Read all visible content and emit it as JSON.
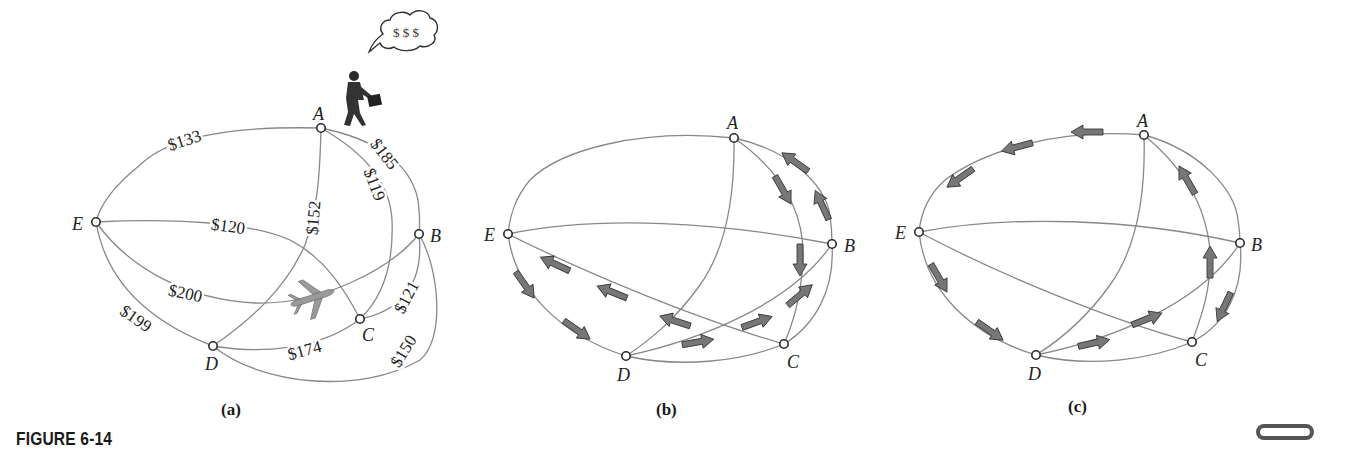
{
  "figure": {
    "caption": "FIGURE 6-14",
    "panels": [
      {
        "id": "a",
        "label": "(a)",
        "nodes": [
          {
            "name": "A",
            "x": 321,
            "y": 128,
            "lx": 313,
            "ly": 120
          },
          {
            "name": "B",
            "x": 419,
            "y": 234,
            "lx": 430,
            "ly": 242
          },
          {
            "name": "C",
            "x": 360,
            "y": 319,
            "lx": 362,
            "ly": 341
          },
          {
            "name": "D",
            "x": 213,
            "y": 346,
            "lx": 205,
            "ly": 370
          },
          {
            "name": "E",
            "x": 96,
            "y": 222,
            "lx": 72,
            "ly": 230
          }
        ],
        "edges": [
          {
            "from": "A",
            "to": "E",
            "cost": "$133",
            "path": "M321,128 C240,126 170,135 140,165 C115,185 100,205 96,222",
            "lx": 185,
            "ly": 142,
            "rot": -18
          },
          {
            "from": "A",
            "to": "B",
            "cost": "$185",
            "path": "M321,128 C370,138 410,160 418,200 C420,215 420,225 419,234",
            "lx": 383,
            "ly": 155,
            "rot": 52
          },
          {
            "from": "A",
            "to": "C",
            "cost": "$119",
            "path": "M321,128 C360,150 390,180 392,220 C394,270 380,300 360,319",
            "lx": 373,
            "ly": 185,
            "rot": 70
          },
          {
            "from": "A",
            "to": "D",
            "cost": "$152",
            "path": "M321,128 C320,170 318,210 305,245 C285,290 250,320 213,346",
            "lx": 315,
            "ly": 218,
            "rot": -85
          },
          {
            "from": "E",
            "to": "C",
            "cost": "$120",
            "path": "M96,222 C170,218 250,222 290,240 C325,258 345,290 360,319",
            "lx": 228,
            "ly": 228,
            "rot": 8
          },
          {
            "from": "E",
            "to": "B",
            "cost": "$200",
            "path": "M96,222 C130,270 190,300 255,303 C320,305 390,270 419,234",
            "lx": 185,
            "ly": 295,
            "rot": 12
          },
          {
            "from": "E",
            "to": "D",
            "cost": "$199",
            "path": "M96,222 C105,275 140,318 213,346",
            "lx": 135,
            "ly": 320,
            "rot": 35
          },
          {
            "from": "D",
            "to": "C",
            "cost": "$174",
            "path": "M213,346 C260,354 320,350 360,319",
            "lx": 305,
            "ly": 352,
            "rot": -15
          },
          {
            "from": "C",
            "to": "B",
            "cost": "$121",
            "path": "M360,319 C395,312 425,290 419,234",
            "lx": 408,
            "ly": 298,
            "rot": -62
          },
          {
            "from": "D",
            "to": "B",
            "cost": "$150",
            "path": "M213,346 C260,385 360,395 420,360 C445,340 440,270 419,234",
            "lx": 405,
            "ly": 352,
            "rot": -58
          }
        ],
        "decorations": {
          "person_icon": "businessman-walking-icon",
          "thought_bubble_text": "$ $ $",
          "airplane_icon": "airplane-icon"
        }
      },
      {
        "id": "b",
        "label": "(b)",
        "nodes": [
          {
            "name": "A",
            "x": 734,
            "y": 138,
            "lx": 727,
            "ly": 129
          },
          {
            "name": "B",
            "x": 832,
            "y": 244,
            "lx": 844,
            "ly": 252
          },
          {
            "name": "C",
            "x": 784,
            "y": 344,
            "lx": 787,
            "ly": 368
          },
          {
            "name": "D",
            "x": 626,
            "y": 356,
            "lx": 617,
            "ly": 381
          },
          {
            "name": "E",
            "x": 508,
            "y": 234,
            "lx": 484,
            "ly": 241
          }
        ],
        "edges": [
          {
            "from": "A",
            "to": "E",
            "path": "M734,138 C640,128 560,150 530,180 C515,198 510,215 508,234"
          },
          {
            "from": "A",
            "to": "B",
            "path": "M734,138 C790,150 825,185 830,215 C832,230 832,238 832,244"
          },
          {
            "from": "A",
            "to": "C",
            "path": "M734,138 C780,170 805,210 803,260 C801,300 792,325 784,344"
          },
          {
            "from": "A",
            "to": "D",
            "path": "M734,138 C735,200 725,250 700,285 C675,320 650,340 626,356"
          },
          {
            "from": "E",
            "to": "B",
            "path": "M508,234 C600,215 720,222 832,244"
          },
          {
            "from": "E",
            "to": "C",
            "path": "M508,234 C590,275 700,320 784,344"
          },
          {
            "from": "E",
            "to": "D",
            "path": "M508,234 C515,290 560,335 626,356"
          },
          {
            "from": "D",
            "to": "C",
            "path": "M626,356 C680,368 740,362 784,344"
          },
          {
            "from": "D",
            "to": "B",
            "path": "M626,356 C700,340 790,305 832,244"
          },
          {
            "from": "C",
            "to": "B",
            "path": "M784,344 C815,325 835,290 832,244"
          }
        ],
        "arrows": [
          {
            "x": 795,
            "y": 162,
            "angle": -145
          },
          {
            "x": 822,
            "y": 205,
            "angle": -115
          },
          {
            "x": 783,
            "y": 190,
            "angle": 60
          },
          {
            "x": 800,
            "y": 260,
            "angle": 90
          },
          {
            "x": 555,
            "y": 264,
            "angle": -155
          },
          {
            "x": 612,
            "y": 292,
            "angle": -158
          },
          {
            "x": 675,
            "y": 321,
            "angle": -162
          },
          {
            "x": 525,
            "y": 285,
            "angle": 55
          },
          {
            "x": 577,
            "y": 330,
            "angle": 35
          },
          {
            "x": 698,
            "y": 342,
            "angle": -10
          },
          {
            "x": 757,
            "y": 322,
            "angle": -20
          },
          {
            "x": 800,
            "y": 295,
            "angle": -40
          }
        ]
      },
      {
        "id": "c",
        "label": "(c)",
        "nodes": [
          {
            "name": "A",
            "x": 1144,
            "y": 135,
            "lx": 1137,
            "ly": 127
          },
          {
            "name": "B",
            "x": 1240,
            "y": 243,
            "lx": 1251,
            "ly": 251
          },
          {
            "name": "C",
            "x": 1192,
            "y": 342,
            "lx": 1195,
            "ly": 366
          },
          {
            "name": "D",
            "x": 1036,
            "y": 355,
            "lx": 1028,
            "ly": 380
          },
          {
            "name": "E",
            "x": 919,
            "y": 232,
            "lx": 895,
            "ly": 239
          }
        ],
        "edges": [
          {
            "from": "A",
            "to": "E",
            "path": "M1144,135 C1060,128 985,150 945,180 C928,195 921,212 919,232"
          },
          {
            "from": "A",
            "to": "B",
            "path": "M1144,135 C1200,150 1235,190 1238,220 C1240,232 1240,238 1240,243"
          },
          {
            "from": "A",
            "to": "C",
            "path": "M1144,135 C1180,165 1205,200 1210,250 C1212,290 1200,320 1192,342"
          },
          {
            "from": "A",
            "to": "D",
            "path": "M1144,135 C1146,200 1135,250 1110,285 C1085,320 1060,340 1036,355"
          },
          {
            "from": "E",
            "to": "B",
            "path": "M919,232 C1010,215 1130,218 1240,243"
          },
          {
            "from": "E",
            "to": "C",
            "path": "M919,232 C1000,275 1110,320 1192,342"
          },
          {
            "from": "E",
            "to": "D",
            "path": "M919,232 C925,290 970,335 1036,355"
          },
          {
            "from": "D",
            "to": "C",
            "path": "M1036,355 C1090,368 1150,360 1192,342"
          },
          {
            "from": "D",
            "to": "B",
            "path": "M1036,355 C1110,340 1200,305 1240,243"
          },
          {
            "from": "C",
            "to": "B",
            "path": "M1192,342 C1225,325 1245,290 1240,243"
          }
        ],
        "arrows": [
          {
            "x": 1087,
            "y": 132,
            "angle": 180
          },
          {
            "x": 1017,
            "y": 147,
            "angle": 165
          },
          {
            "x": 960,
            "y": 178,
            "angle": 145
          },
          {
            "x": 1187,
            "y": 180,
            "angle": -120
          },
          {
            "x": 1210,
            "y": 262,
            "angle": -90
          },
          {
            "x": 1224,
            "y": 307,
            "angle": 115
          },
          {
            "x": 939,
            "y": 278,
            "angle": 60
          },
          {
            "x": 990,
            "y": 331,
            "angle": 35
          },
          {
            "x": 1094,
            "y": 343,
            "angle": -12
          },
          {
            "x": 1147,
            "y": 319,
            "angle": -22
          }
        ]
      }
    ]
  },
  "colors": {
    "edge": "#888888",
    "node_stroke": "#2a2a2a",
    "node_fill": "#ffffff",
    "label": "#222222",
    "arrow_fill": "#777777",
    "arrow_stroke": "#3a3a3a"
  }
}
